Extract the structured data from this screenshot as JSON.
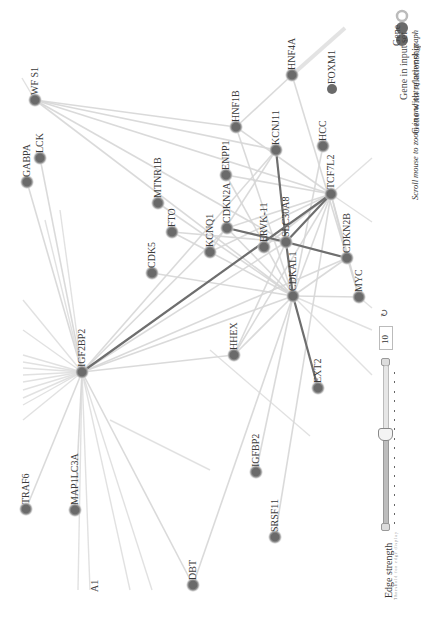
{
  "graph": {
    "orientation": "rotated-90-ccw",
    "colors": {
      "node": "#6a6a6a",
      "node_halo": "#c8c8c8",
      "edge_weak": "#d6d6d6",
      "edge_strong": "#6e6e6e",
      "label": "#3a3a3a"
    },
    "nodes": [
      {
        "id": "WFS1",
        "label": "WF S1",
        "x": 35,
        "y": 100
      },
      {
        "id": "LCK",
        "label": "LCK",
        "x": 40,
        "y": 158
      },
      {
        "id": "GABPA",
        "label": "GABPA",
        "x": 27,
        "y": 182
      },
      {
        "id": "MTNR1B",
        "label": "MTNR1B",
        "x": 158,
        "y": 203
      },
      {
        "id": "FTO",
        "label": "FTO",
        "x": 172,
        "y": 232
      },
      {
        "id": "CDK5",
        "label": "CDK5",
        "x": 152,
        "y": 273
      },
      {
        "id": "KCNQ1",
        "label": "KCNQ1",
        "x": 210,
        "y": 252
      },
      {
        "id": "CDKN2A",
        "label": "CDKN2A",
        "x": 227,
        "y": 228
      },
      {
        "id": "ENPP1",
        "label": "ENPP1",
        "x": 226,
        "y": 175
      },
      {
        "id": "ERVK11",
        "label": "ERVK-11",
        "x": 264,
        "y": 247
      },
      {
        "id": "SLC30A8",
        "label": "SLC30A8",
        "x": 286,
        "y": 242
      },
      {
        "id": "KCNJ11",
        "label": "KCNJ11",
        "x": 276,
        "y": 150
      },
      {
        "id": "HNF1B",
        "label": "HNF1B",
        "x": 236,
        "y": 127
      },
      {
        "id": "HNF4A",
        "label": "HNF4A",
        "x": 292,
        "y": 75
      },
      {
        "id": "HCC",
        "label": "HCC",
        "x": 323,
        "y": 146
      },
      {
        "id": "TCF7L2",
        "label": "TCF7L2",
        "x": 331,
        "y": 194
      },
      {
        "id": "CDKN2B",
        "label": "CDKN2B",
        "x": 347,
        "y": 258
      },
      {
        "id": "CDKAL1",
        "label": "CDKAL1",
        "x": 293,
        "y": 296
      },
      {
        "id": "MYC",
        "label": "MYC",
        "x": 359,
        "y": 297
      },
      {
        "id": "HHEX",
        "label": "HHEX",
        "x": 234,
        "y": 355
      },
      {
        "id": "EXT2",
        "label": "EXT2",
        "x": 318,
        "y": 388
      },
      {
        "id": "IGF2BP2",
        "label": "IGF2BP2",
        "x": 82,
        "y": 372
      },
      {
        "id": "IGFBP2",
        "label": "IGFBP2",
        "x": 256,
        "y": 472
      },
      {
        "id": "SRSF11",
        "label": "SRSF11",
        "x": 275,
        "y": 537
      },
      {
        "id": "TRAF6",
        "label": "TRAF6",
        "x": 26,
        "y": 509
      },
      {
        "id": "MAP1LC3A",
        "label": "MAP1LC3A",
        "x": 75,
        "y": 510
      },
      {
        "id": "DBT",
        "label": "DBT",
        "x": 193,
        "y": 585
      },
      {
        "id": "FOXM1",
        "label": "FOXM1",
        "x": 332,
        "y": 89
      }
    ],
    "partial_labels": [
      {
        "label": "A1",
        "x": 95,
        "y": 592
      }
    ],
    "strong_edges": [
      [
        "IGF2BP2",
        "TCF7L2"
      ],
      [
        "CDKN2A",
        "SLC30A8"
      ],
      [
        "SLC30A8",
        "CDKN2B"
      ],
      [
        "SLC30A8",
        "TCF7L2"
      ],
      [
        "KCNJ11",
        "SLC30A8"
      ],
      [
        "CDKAL1",
        "EXT2"
      ],
      [
        "SLC30A8",
        "CDKAL1"
      ]
    ],
    "weak_edges": [
      [
        "WFS1",
        "TCF7L2"
      ],
      [
        "WFS1",
        "KCNJ11"
      ],
      [
        "WFS1",
        "HNF1B"
      ],
      [
        "WFS1",
        "SLC30A8"
      ],
      [
        "WFS1",
        "CDKAL1"
      ],
      [
        "LCK",
        "IGF2BP2"
      ],
      [
        "GABPA",
        "IGF2BP2"
      ],
      [
        "MTNR1B",
        "CDKAL1"
      ],
      [
        "FTO",
        "KCNQ1"
      ],
      [
        "FTO",
        "SLC30A8"
      ],
      [
        "CDK5",
        "CDKAL1"
      ],
      [
        "KCNQ1",
        "TCF7L2"
      ],
      [
        "KCNQ1",
        "KCNJ11"
      ],
      [
        "KCNQ1",
        "CDKAL1"
      ],
      [
        "CDKN2A",
        "TCF7L2"
      ],
      [
        "CDKN2A",
        "CDKN2B"
      ],
      [
        "CDKN2A",
        "CDKAL1"
      ],
      [
        "ENPP1",
        "TCF7L2"
      ],
      [
        "ENPP1",
        "CDKAL1"
      ],
      [
        "HNF1B",
        "TCF7L2"
      ],
      [
        "HNF1B",
        "CDKAL1"
      ],
      [
        "HNF1B",
        "HNF4A"
      ],
      [
        "HNF4A",
        "MYC"
      ],
      [
        "HCC",
        "CDKAL1"
      ],
      [
        "TCF7L2",
        "CDKAL1"
      ],
      [
        "TCF7L2",
        "MYC"
      ],
      [
        "TCF7L2",
        "CDKN2B"
      ],
      [
        "CDKN2B",
        "CDKAL1"
      ],
      [
        "MYC",
        "CDKAL1"
      ],
      [
        "HHEX",
        "TCF7L2"
      ],
      [
        "HHEX",
        "CDKAL1"
      ],
      [
        "HHEX",
        "SLC30A8"
      ],
      [
        "IGF2BP2",
        "CDKAL1"
      ],
      [
        "IGF2BP2",
        "SLC30A8"
      ],
      [
        "IGF2BP2",
        "CDKN2A"
      ],
      [
        "IGF2BP2",
        "KCNJ11"
      ],
      [
        "IGF2BP2",
        "HHEX"
      ],
      [
        "IGF2BP2",
        "CDKN2B"
      ],
      [
        "IGF2BP2",
        "MAP1LC3A"
      ],
      [
        "IGF2BP2",
        "TRAF6"
      ],
      [
        "IGF2BP2",
        "DBT"
      ],
      [
        "IGFBP2",
        "CDKAL1"
      ],
      [
        "SRSF11",
        "TCF7L2"
      ],
      [
        "DBT",
        "CDKAL1"
      ],
      [
        "ERVK11",
        "TCF7L2"
      ]
    ]
  },
  "legend": {
    "items": [
      {
        "label": "FOXM1",
        "type": "sample-node"
      },
      {
        "label": "Gene",
        "type": "gene"
      },
      {
        "label": "Gene in input set",
        "type": "gene-input"
      },
      {
        "label": "Gene with relationship",
        "type": "gene-relationship"
      }
    ],
    "hint": "Scroll mouse to zoom in and out of network graph"
  },
  "controls": {
    "edge_strength_label": "Edge strength",
    "edge_strength_sublabel": "Threshold for edge display",
    "slider_value": "10",
    "reset_icon": "refresh-icon"
  }
}
